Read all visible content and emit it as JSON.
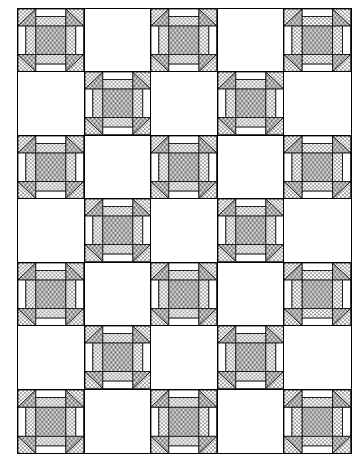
{
  "diagram": {
    "type": "quilt-layout",
    "columns": 5,
    "rows": 7,
    "layout_rule": "pieced block where (row + col) is even, plain white square otherwise",
    "grid": [
      [
        "block",
        "plain",
        "block",
        "plain",
        "block"
      ],
      [
        "plain",
        "block",
        "plain",
        "block",
        "plain"
      ],
      [
        "block",
        "plain",
        "block",
        "plain",
        "block"
      ],
      [
        "plain",
        "block",
        "plain",
        "block",
        "plain"
      ],
      [
        "block",
        "plain",
        "block",
        "plain",
        "block"
      ],
      [
        "plain",
        "block",
        "plain",
        "block",
        "plain"
      ],
      [
        "block",
        "plain",
        "block",
        "plain",
        "block"
      ]
    ],
    "block_count": 18,
    "plain_count": 17,
    "block_structure": {
      "corners": "half-square triangles: dotted fabric toward outer corner, grey stipple toward center",
      "edges": "two-strip units: white outer strip, dotted inner strip",
      "center": "grey stipple square"
    },
    "colors": {
      "outline": "#000000",
      "background": "#ffffff",
      "stipple": "#9a9a9a",
      "dots": "#000000"
    }
  }
}
